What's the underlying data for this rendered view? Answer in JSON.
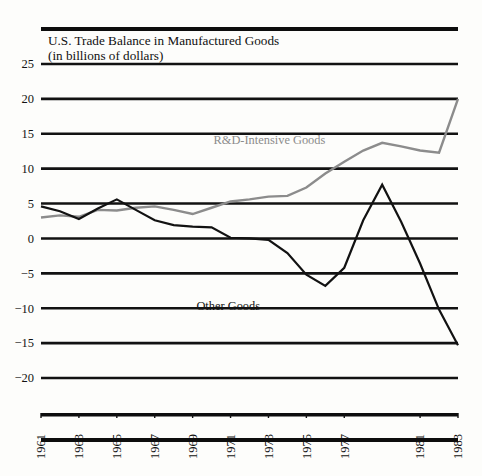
{
  "figure": {
    "title_line1": "U.S. Trade Balance in Manufactured Goods",
    "title_line2": "(in billions of dollars)",
    "background_color": "#fdfdfb"
  },
  "colors": {
    "ink": "#121212",
    "rd_intensive": "#8c8c8c",
    "other_goods": "#121212",
    "rule": "#0d0d0d"
  },
  "chart_data": {
    "type": "line",
    "title": "U.S. Trade Balance in Manufactured Goods",
    "subtitle": "(in billions of dollars)",
    "xlabel": "",
    "ylabel": "",
    "ylim": [
      -22,
      26
    ],
    "xlim": [
      1961,
      1983
    ],
    "grid": true,
    "legend_position": "inline-annotation",
    "yticks": [
      25,
      20,
      15,
      10,
      5,
      0,
      -5,
      -10,
      -15,
      -20
    ],
    "ytick_labels": [
      "25",
      "20",
      "15",
      "10",
      "5",
      "0",
      "−5",
      "−10",
      "−15",
      "−20"
    ],
    "x": [
      1961,
      1962,
      1963,
      1964,
      1965,
      1966,
      1967,
      1968,
      1969,
      1970,
      1971,
      1972,
      1973,
      1974,
      1975,
      1976,
      1977,
      1978,
      1979,
      1980,
      1981,
      1982,
      1983
    ],
    "xtick_values": [
      1961,
      1963,
      1965,
      1967,
      1969,
      1971,
      1973,
      1975,
      1977,
      1981,
      1983
    ],
    "xtick_labels": [
      "1961",
      "1963",
      "1965",
      "1967",
      "1969",
      "1971",
      "1973",
      "1975",
      "1977",
      "1981",
      "1983"
    ],
    "series": [
      {
        "name": "R&D-Intensive Goods",
        "color": "#8c8c8c",
        "label_x": 1970.1,
        "label_y": 13.6,
        "values": [
          3.0,
          3.3,
          3.1,
          4.1,
          4.0,
          4.4,
          4.6,
          4.1,
          3.5,
          4.4,
          5.3,
          5.6,
          6.0,
          6.1,
          7.3,
          9.3,
          11.0,
          12.6,
          13.7,
          13.2,
          12.6,
          12.3,
          20.0
        ]
      },
      {
        "name": "Other Goods",
        "color": "#121212",
        "label_x": 1969.2,
        "label_y": -10.2,
        "values": [
          4.6,
          3.9,
          2.8,
          4.3,
          5.6,
          4.1,
          2.6,
          1.9,
          1.7,
          1.6,
          0.1,
          0.0,
          -0.2,
          -2.1,
          -5.2,
          -6.8,
          -4.2,
          2.6,
          7.7,
          2.4,
          -3.6,
          -10.2,
          -15.3
        ]
      }
    ],
    "annotations": [
      {
        "text": "R&D-Intensive Goods",
        "color": "#8c8c8c"
      },
      {
        "text": "Other Goods",
        "color": "#121212"
      }
    ]
  }
}
